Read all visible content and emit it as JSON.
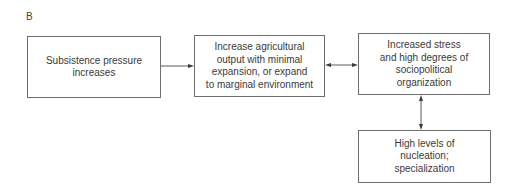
{
  "panel_label": "B",
  "boxes": {
    "subsistence": {
      "text": "Subsistence pressure\nincreases"
    },
    "agricultural": {
      "text": "Increase agricultural\noutput with minimal\nexpansion, or expand\nto marginal environment"
    },
    "stress": {
      "text": "Increased stress\nand high degrees of\nsociopolitical\norganization"
    },
    "nucleation": {
      "text": "High levels of\nnucleation;\nspecialization"
    }
  },
  "connectors": [
    {
      "from": "subsistence",
      "to": "agricultural",
      "type": "single-arrow"
    },
    {
      "from": "agricultural",
      "to": "stress",
      "type": "double-arrow"
    },
    {
      "from": "stress",
      "to": "nucleation",
      "type": "double-arrow"
    }
  ],
  "colors": {
    "line": "#5a5a5a",
    "border": "#6e6e6e",
    "text": "#3a3a3a"
  }
}
